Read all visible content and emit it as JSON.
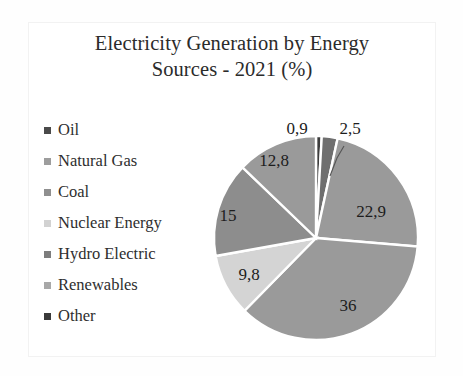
{
  "chart_data": {
    "type": "pie",
    "title": "Electricity Generation by Energy Sources - 2021 (%)",
    "title_line1": "Electricity Generation by Energy",
    "title_line2": "Sources - 2021 (%)",
    "xlabel": "",
    "ylabel": "",
    "legend_position": "left",
    "categories": [
      "Oil",
      "Natural Gas",
      "Coal",
      "Nuclear Energy",
      "Hydro Electric",
      "Renewables",
      "Other"
    ],
    "values": [
      0.9,
      22.9,
      36,
      9.8,
      15,
      12.8,
      2.5
    ],
    "value_labels": [
      "0,9",
      "22,9",
      "36",
      "9,8",
      "15",
      "12,8",
      "2,5"
    ],
    "colors": [
      "#3d3d3d",
      "#9a9a9a",
      "#9a9a9a",
      "#d4d4d4",
      "#8d8d8d",
      "#6f6f6f",
      "#3d3d3d"
    ],
    "slices": [
      {
        "name": "Oil",
        "value": 0.9,
        "label": "0,9",
        "color": "#3d3d3d",
        "label_type": "callout"
      },
      {
        "name": "Renewables",
        "value": 2.5,
        "label": "2,5",
        "color": "#6f6f6f",
        "label_type": "callout"
      },
      {
        "name": "Natural Gas",
        "value": 22.9,
        "label": "22,9",
        "color": "#9a9a9a",
        "label_type": "inside"
      },
      {
        "name": "Coal",
        "value": 36,
        "label": "36",
        "color": "#9a9a9a",
        "label_type": "inside"
      },
      {
        "name": "Nuclear Energy",
        "value": 9.8,
        "label": "9,8",
        "color": "#d4d4d4",
        "label_type": "inside"
      },
      {
        "name": "Hydro Electric",
        "value": 15,
        "label": "15",
        "color": "#8d8d8d",
        "label_type": "inside"
      },
      {
        "name": "Other",
        "value": 12.8,
        "label": "12,8",
        "color": "#9a9a9a",
        "label_type": "inside"
      }
    ],
    "total": 99.9
  },
  "legend": {
    "items": [
      {
        "label": "Oil",
        "color": "#4a4a4a"
      },
      {
        "label": "Natural Gas",
        "color": "#9d9d9d"
      },
      {
        "label": "Coal",
        "color": "#8f8f8f"
      },
      {
        "label": "Nuclear Energy",
        "color": "#d2d2d2"
      },
      {
        "label": "Hydro Electric",
        "color": "#7d7d7d"
      },
      {
        "label": "Renewables",
        "color": "#a8a8a8"
      },
      {
        "label": "Other",
        "color": "#3a3a3a"
      }
    ]
  },
  "pie_labels": {
    "inside": [
      {
        "text": "22,9",
        "x": 175,
        "y": 99
      },
      {
        "text": "36",
        "x": 152,
        "y": 193
      },
      {
        "text": "9,8",
        "x": 53,
        "y": 162
      },
      {
        "text": "15",
        "x": 32,
        "y": 103
      },
      {
        "text": "12,8",
        "x": 78,
        "y": 48
      }
    ],
    "callouts": [
      {
        "text": "0,9",
        "x": 101,
        "y": 16
      },
      {
        "text": "2,5",
        "x": 154,
        "y": 16
      }
    ]
  }
}
